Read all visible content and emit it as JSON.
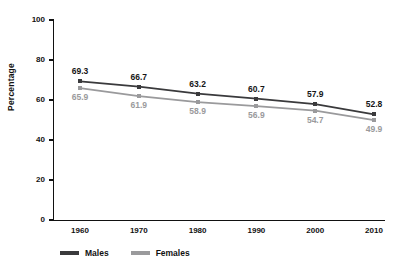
{
  "chart_data": {
    "type": "line",
    "title": "",
    "xlabel": "",
    "ylabel": "Percentage",
    "categories": [
      "1960",
      "1970",
      "1980",
      "1990",
      "2000",
      "2010"
    ],
    "x": [
      1960,
      1970,
      1980,
      1990,
      2000,
      2010
    ],
    "ylim": [
      0,
      100
    ],
    "yticks": [
      "0",
      "20",
      "40",
      "60",
      "80",
      "100"
    ],
    "grid": false,
    "legend_position": "bottom-left",
    "series": [
      {
        "name": "Males",
        "color": "#3a3a3c",
        "values": [
          69.3,
          66.7,
          63.2,
          60.7,
          57.9,
          52.8
        ],
        "labels": [
          "69.3",
          "66.7",
          "63.2",
          "60.7",
          "57.9",
          "52.8"
        ],
        "label_position": "above"
      },
      {
        "name": "Females",
        "color": "#9a9a9c",
        "values": [
          65.9,
          61.9,
          58.9,
          56.9,
          54.7,
          49.9
        ],
        "labels": [
          "65.9",
          "61.9",
          "58.9",
          "56.9",
          "54.7",
          "49.9"
        ],
        "label_position": "below"
      }
    ]
  },
  "legend": {
    "items": [
      {
        "label": "Males",
        "swatch": "males-line-swatch"
      },
      {
        "label": "Females",
        "swatch": "females-line-swatch"
      }
    ]
  }
}
